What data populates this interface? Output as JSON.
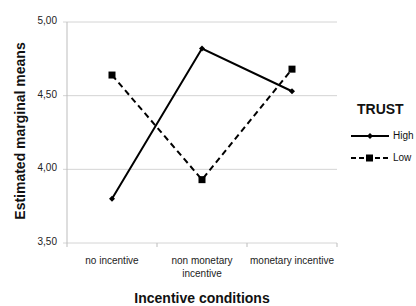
{
  "chart_data": {
    "type": "line",
    "title": "",
    "xlabel": "Incentive conditions",
    "ylabel": "Estimated marginal means",
    "categories": [
      "no incentive",
      "non monetary incentive",
      "monetary incentive"
    ],
    "category_lines": [
      [
        "no incentive"
      ],
      [
        "non monetary",
        "incentive"
      ],
      [
        "monetary incentive"
      ]
    ],
    "yticks": [
      "5,00",
      "4,50",
      "4,00",
      "3,50"
    ],
    "ytick_values": [
      5.0,
      4.5,
      4.0,
      3.5
    ],
    "ylim": [
      3.5,
      5.0
    ],
    "grid": true,
    "legend": {
      "title": "TRUST",
      "position": "right"
    },
    "series": [
      {
        "name": "High",
        "values": [
          3.8,
          4.82,
          4.53
        ],
        "line_style": "solid",
        "marker": "diamond",
        "color": "#000000"
      },
      {
        "name": "Low",
        "values": [
          4.64,
          3.93,
          4.68
        ],
        "line_style": "dashed",
        "marker": "square",
        "color": "#000000"
      }
    ]
  },
  "colors": {
    "gridline": "#d4d4d4",
    "axis": "#bdbdbd",
    "series": "#000000"
  }
}
